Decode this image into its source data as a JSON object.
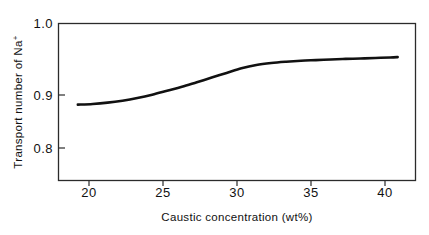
{
  "chart_data": {
    "type": "line",
    "title": "",
    "xlabel": "Caustic concentration (wt%)",
    "ylabel": "Transport number of Na+",
    "ylabel_main": "Transport number of Na",
    "ylabel_superscript": "+",
    "xlim": [
      18.2,
      42.2
    ],
    "ylim": [
      0.762,
      1.0
    ],
    "xticks": [
      20,
      25,
      30,
      35,
      40
    ],
    "xtick_labels": [
      "20",
      "25",
      "30",
      "35",
      "40"
    ],
    "yticks": [
      0.8,
      0.9,
      1.0
    ],
    "ytick_labels": [
      "0.8",
      "0.9",
      "1.0"
    ],
    "grid": false,
    "legend": null,
    "frame": "box",
    "line_color": "#111111",
    "line_width_px": 2.6,
    "series": [
      {
        "name": "Transport number of Na+",
        "x": [
          19.5,
          20.5,
          21.5,
          22.5,
          23.5,
          24.5,
          25.5,
          26.5,
          27.5,
          28.5,
          29.5,
          30.5,
          31.5,
          32.5,
          33.5,
          34.5,
          35.5,
          36.5,
          37.5,
          38.5,
          39.5,
          40.5,
          41.0
        ],
        "values": [
          0.877,
          0.878,
          0.88,
          0.883,
          0.887,
          0.892,
          0.898,
          0.904,
          0.911,
          0.918,
          0.925,
          0.932,
          0.937,
          0.94,
          0.942,
          0.9435,
          0.9445,
          0.9455,
          0.9463,
          0.947,
          0.9477,
          0.9485,
          0.949
        ]
      }
    ]
  },
  "axes": {
    "x_tick_label_0": "20",
    "x_tick_label_1": "25",
    "x_tick_label_2": "30",
    "x_tick_label_3": "35",
    "x_tick_label_4": "40",
    "y_tick_label_0": "1.0",
    "y_tick_label_1": "0.9",
    "y_tick_label_2": "0.8"
  },
  "labels": {
    "x_axis_title": "Caustic concentration (wt%)",
    "y_axis_title_main": "Transport number of Na",
    "y_axis_title_sup": "+"
  },
  "colors": {
    "background": "#ffffff",
    "axis": "#2b2b2b",
    "curve": "#111111",
    "text": "#111111"
  }
}
